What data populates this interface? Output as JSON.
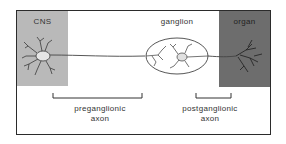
{
  "diagram": {
    "type": "neuron pathway schematic",
    "regions": {
      "cns": {
        "label": "CNS",
        "color": "#b9b9b9"
      },
      "ganglion": {
        "label": "ganglion"
      },
      "organ": {
        "label": "organ",
        "color": "#6d6d6d"
      }
    },
    "brackets": {
      "preganglionic": {
        "line1": "preganglionic",
        "line2": "axon"
      },
      "postganglionic": {
        "line1": "postganglionic",
        "line2": "axon"
      }
    },
    "colors": {
      "frame": "#2b2b2b",
      "line": "#444444",
      "text": "#333333"
    }
  }
}
